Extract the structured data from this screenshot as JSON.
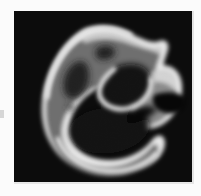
{
  "document": {
    "kind": "grayscale-micrograph-figure",
    "page_background": "#fbfbfb",
    "plate_background": "#050505",
    "caption": ""
  },
  "figure": {
    "title": "",
    "panel_label": "",
    "frame": {
      "x": 14,
      "y": 11,
      "width": 178,
      "height": 171
    },
    "subject_description": "irregular C-shaped (horseshoe) specimen with bright outer rim, mid-grey body and dark interior cavities",
    "tonal_levels": {
      "background_black": "#050505",
      "cavity_black": "#0a0a0a",
      "dark_grey": "#3a3a3a",
      "mid_grey": "#6f6f6f",
      "light_grey": "#a9a9a9",
      "rim_white": "#eeeeee",
      "highlight_white": "#f6f6f6"
    },
    "features": [
      {
        "name": "upper-lobe",
        "tone": "mid-grey"
      },
      {
        "name": "left-cavity",
        "tone": "near-black"
      },
      {
        "name": "upper-slit-cavity",
        "tone": "near-black"
      },
      {
        "name": "central-cavity",
        "tone": "black"
      },
      {
        "name": "lower-band-cavity",
        "tone": "near-black"
      },
      {
        "name": "right-lobe",
        "tone": "light-grey"
      },
      {
        "name": "right-notch-gap",
        "tone": "background-black"
      }
    ],
    "margin_tick": {
      "visible": true,
      "color": "#cfcfcf"
    }
  }
}
